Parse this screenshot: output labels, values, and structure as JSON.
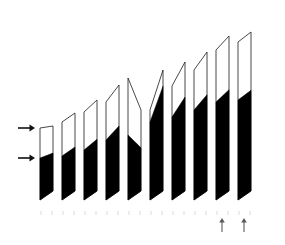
{
  "figure": {
    "background_color": "#ffffff",
    "ink_color": "#000000",
    "outline_color": "#1a1a1a",
    "tick_color": "#c9c9c9",
    "marker_color": "#5a5a5a",
    "title": "",
    "caption": ""
  },
  "chart_data": {
    "type": "bar",
    "title": "",
    "subtitle": "",
    "xlabel": "",
    "ylabel": "",
    "grid": false,
    "legend": null,
    "orientation": "vertical",
    "style": "skewed-parallelogram-3d-outline-with-black-fill",
    "categories": [
      "1",
      "2",
      "3",
      "4",
      "5",
      "6",
      "7",
      "8",
      "9",
      "10"
    ],
    "tick_labels": [
      "",
      "",
      "",
      "",
      "",
      "",
      "",
      "",
      "",
      ""
    ],
    "ylim": [
      0,
      100
    ],
    "series": [
      {
        "name": "total",
        "role": "bar-total-height-outline",
        "values": [
          41,
          54,
          69,
          84,
          92,
          100,
          111,
          124,
          138,
          142
        ]
      },
      {
        "name": "filled",
        "role": "black-filled-portion",
        "values": [
          24,
          26,
          32,
          42,
          47,
          53,
          58,
          65,
          73,
          75
        ]
      }
    ],
    "bars": [
      {
        "index": 1,
        "x_left": 40,
        "x_right": 53,
        "top_left_y": 128,
        "top_right_y": 126,
        "bottom_y": 200,
        "fill_top_y": 158,
        "total_height": 72,
        "filled_height": 42,
        "filled_fraction": 0.58
      },
      {
        "index": 2,
        "x_left": 62,
        "x_right": 75,
        "top_left_y": 122,
        "top_right_y": 113,
        "bottom_y": 200,
        "fill_top_y": 156,
        "total_height": 82,
        "filled_height": 44,
        "filled_fraction": 0.54
      },
      {
        "index": 3,
        "x_left": 84,
        "x_right": 97,
        "top_left_y": 112,
        "top_right_y": 100,
        "bottom_y": 200,
        "fill_top_y": 150,
        "total_height": 94,
        "filled_height": 50,
        "filled_fraction": 0.53
      },
      {
        "index": 4,
        "x_left": 106,
        "x_right": 119,
        "top_left_y": 102,
        "top_right_y": 85,
        "bottom_y": 200,
        "fill_top_y": 140,
        "total_height": 105,
        "filled_height": 60,
        "filled_fraction": 0.57
      },
      {
        "index": 5,
        "x_left": 128,
        "x_right": 141,
        "top_left_y": 78,
        "top_right_y": 110,
        "bottom_y": 200,
        "fill_top_y": 135,
        "total_height": 112,
        "filled_height": 65,
        "filled_fraction": 0.58
      },
      {
        "index": 6,
        "x_left": 150,
        "x_right": 163,
        "top_left_y": 110,
        "top_right_y": 70,
        "bottom_y": 200,
        "fill_top_y": 122,
        "total_height": 120,
        "filled_height": 78,
        "filled_fraction": 0.65
      },
      {
        "index": 7,
        "x_left": 172,
        "x_right": 185,
        "top_left_y": 86,
        "top_right_y": 62,
        "bottom_y": 200,
        "fill_top_y": 117,
        "total_height": 128,
        "filled_height": 83,
        "filled_fraction": 0.65
      },
      {
        "index": 8,
        "x_left": 194,
        "x_right": 207,
        "top_left_y": 70,
        "top_right_y": 52,
        "bottom_y": 200,
        "fill_top_y": 110,
        "total_height": 138,
        "filled_height": 90,
        "filled_fraction": 0.65
      },
      {
        "index": 9,
        "x_left": 216,
        "x_right": 229,
        "top_left_y": 50,
        "top_right_y": 36,
        "bottom_y": 200,
        "fill_top_y": 102,
        "total_height": 150,
        "filled_height": 98,
        "filled_fraction": 0.65
      },
      {
        "index": 10,
        "x_left": 238,
        "x_right": 251,
        "top_left_y": 42,
        "top_right_y": 32,
        "bottom_y": 200,
        "fill_top_y": 100,
        "total_height": 155,
        "filled_height": 100,
        "filled_fraction": 0.65
      }
    ],
    "annotations": [
      {
        "kind": "left-arrow-marker",
        "label": "",
        "points_to": "upper-level",
        "y": 128,
        "x_tip": 35,
        "x_tail": 18,
        "direction": "right"
      },
      {
        "kind": "left-arrow-marker",
        "label": "",
        "points_to": "fill-level",
        "y": 158,
        "x_tip": 35,
        "x_tail": 18,
        "direction": "right"
      },
      {
        "kind": "bottom-arrow-marker",
        "label": "",
        "points_to": "bar-9",
        "x": 222,
        "y_tip": 218,
        "y_tail": 232,
        "direction": "up"
      },
      {
        "kind": "bottom-arrow-marker",
        "label": "",
        "points_to": "bar-10",
        "x": 244,
        "y_tip": 218,
        "y_tail": 232,
        "direction": "up"
      }
    ],
    "axis_ticks": {
      "count": 20,
      "y": 211,
      "length": 4,
      "x_positions": [
        41,
        52,
        63,
        74,
        85,
        96,
        107,
        118,
        129,
        140,
        151,
        162,
        173,
        184,
        195,
        206,
        217,
        228,
        239,
        250
      ]
    }
  }
}
